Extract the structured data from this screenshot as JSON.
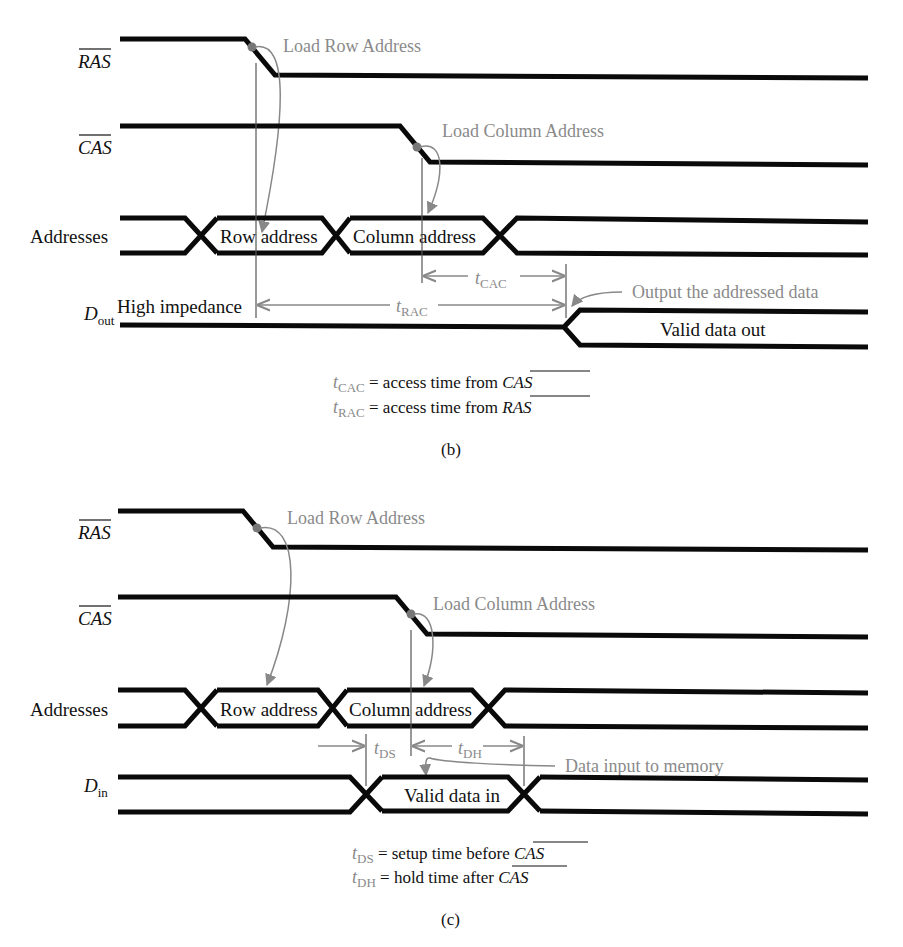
{
  "figure_b": {
    "signals": {
      "ras": "RAS",
      "cas": "CAS",
      "addresses": "Addresses",
      "dout_main": "D",
      "dout_sub": "out"
    },
    "bus_labels": {
      "row": "Row address",
      "column": "Column address",
      "high_z": "High impedance",
      "valid_out": "Valid data out"
    },
    "annotations": {
      "load_row": "Load Row Address",
      "load_col": "Load Column Address",
      "output_data": "Output the addressed data"
    },
    "timing": {
      "tcac_t": "t",
      "tcac_sub": "CAC",
      "trac_t": "t",
      "trac_sub": "RAC"
    },
    "legend": [
      {
        "t": "t",
        "sub": "CAC",
        "text": " = access time from ",
        "signal": "CAS"
      },
      {
        "t": "t",
        "sub": "RAC",
        "text": " = access time from ",
        "signal": "RAS"
      }
    ],
    "caption": "(b)"
  },
  "figure_c": {
    "signals": {
      "ras": "RAS",
      "cas": "CAS",
      "addresses": "Addresses",
      "din_main": "D",
      "din_sub": "in"
    },
    "bus_labels": {
      "row": "Row address",
      "column": "Column address",
      "valid_in": "Valid data in"
    },
    "annotations": {
      "load_row": "Load Row Address",
      "load_col": "Load Column Address",
      "data_input": "Data input to memory"
    },
    "timing": {
      "tds_t": "t",
      "tds_sub": "DS",
      "tdh_t": "t",
      "tdh_sub": "DH"
    },
    "legend": [
      {
        "t": "t",
        "sub": "DS",
        "text": " = setup time before ",
        "signal": "CAS"
      },
      {
        "t": "t",
        "sub": "DH",
        "text": " = hold time after ",
        "signal": "CAS"
      }
    ],
    "caption": "(c)"
  },
  "colors": {
    "signal": "#0a0a0a",
    "annotation": "#8a8a8a",
    "background": "#ffffff"
  }
}
